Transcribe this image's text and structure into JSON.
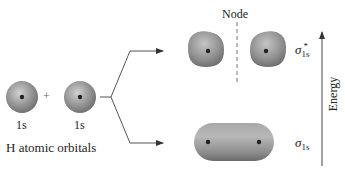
{
  "figure": {
    "atomic_orbitals": {
      "left_label": "1s",
      "right_label": "1s",
      "plus": "+",
      "caption": "H atomic orbitals"
    },
    "antibonding": {
      "node_label": "Node",
      "symbol": "σ",
      "subscript": "1s",
      "superscript": "*"
    },
    "bonding": {
      "symbol": "σ",
      "subscript": "1s"
    },
    "energy_axis": {
      "label": "Energy"
    },
    "colors": {
      "orbital_fill": "#8c8c8c",
      "orbital_highlight": "#c8c8c8",
      "nucleus": "#222222",
      "lines": "#555555"
    }
  }
}
